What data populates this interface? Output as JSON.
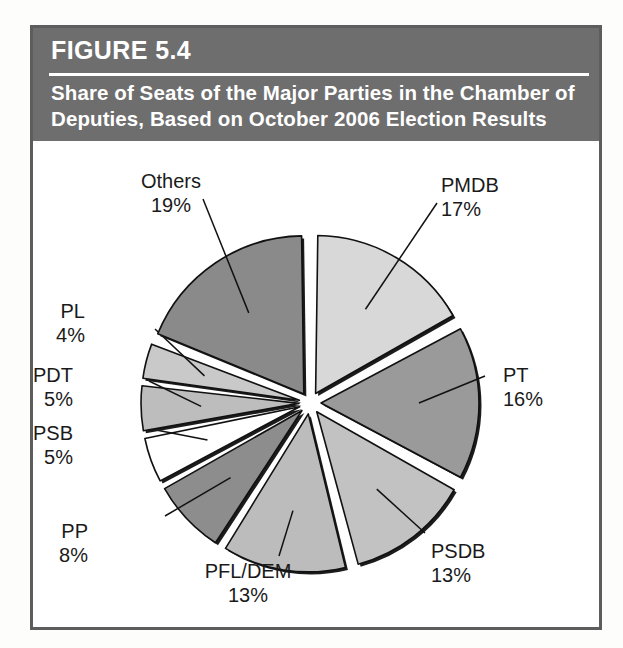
{
  "figure": {
    "number_label": "FIGURE 5.4",
    "title": "Share of Seats of the Major Parties in the Chamber of Deputies, Based on October 2006 Election Results",
    "header_bg": "#6e6e6e",
    "header_text_color": "#ffffff",
    "frame_color": "#5d5d5d"
  },
  "chart_data": {
    "type": "pie",
    "title": "Share of Seats of the Major Parties in the Chamber of Deputies, Based on October 2006 Election Results",
    "xlabel": "",
    "ylabel": "",
    "exploded": true,
    "legend": "none",
    "grid": false,
    "value_suffix": "%",
    "categories": [
      "PMDB",
      "PT",
      "PSDB",
      "PFL/DEM",
      "PP",
      "PSB",
      "PDT",
      "PL",
      "Others"
    ],
    "values": [
      17,
      16,
      13,
      13,
      8,
      5,
      5,
      4,
      19
    ],
    "slices": [
      {
        "name": "PMDB",
        "value": 17,
        "value_label": "17%",
        "color": "#d8d8d8",
        "label_align": "left"
      },
      {
        "name": "PT",
        "value": 16,
        "value_label": "16%",
        "color": "#9a9a9a",
        "label_align": "left"
      },
      {
        "name": "PSDB",
        "value": 13,
        "value_label": "13%",
        "color": "#c2c2c2",
        "label_align": "left"
      },
      {
        "name": "PFL/DEM",
        "value": 13,
        "value_label": "13%",
        "color": "#bcbcbc",
        "label_align": "center"
      },
      {
        "name": "PP",
        "value": 8,
        "value_label": "8%",
        "color": "#8d8d8d",
        "label_align": "right"
      },
      {
        "name": "PSB",
        "value": 5,
        "value_label": "5%",
        "color": "#ffffff",
        "label_align": "right"
      },
      {
        "name": "PDT",
        "value": 5,
        "value_label": "5%",
        "color": "#bdbdbd",
        "label_align": "right"
      },
      {
        "name": "PL",
        "value": 4,
        "value_label": "4%",
        "color": "#c9c9c9",
        "label_align": "right"
      },
      {
        "name": "Others",
        "value": 19,
        "value_label": "19%",
        "color": "#8a8a8a",
        "label_align": "center"
      }
    ]
  }
}
